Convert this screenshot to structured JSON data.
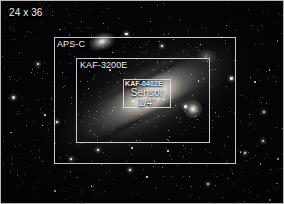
{
  "diagram": {
    "background_image": "andromeda-galaxy-starfield",
    "accent_color": "#e4e4e4",
    "frames": [
      {
        "id": "full-frame",
        "label": "24 x 36",
        "label_position": "top-left-outside",
        "rect": {
          "x": 0,
          "y": 0,
          "w": 284,
          "h": 204
        }
      },
      {
        "id": "aps-c",
        "label": "APS-C",
        "label_position": "top-left-inside",
        "rect": {
          "x": 53,
          "y": 36,
          "w": 182,
          "h": 127
        }
      },
      {
        "id": "kaf-3200e",
        "label": "KAF-3200E",
        "label_position": "top-left-inside",
        "rect": {
          "x": 75,
          "y": 57,
          "w": 134,
          "h": 85
        }
      },
      {
        "id": "kaf-0402e",
        "label": "KAF-0402E",
        "sub_label": "Sensor",
        "size_label": "1/4\"",
        "label_position": "top-left-inside",
        "rect": {
          "x": 122,
          "y": 78,
          "w": 48,
          "h": 29
        }
      }
    ]
  },
  "chart_data": {
    "type": "diagram",
    "categories": [
      "24 x 36",
      "APS-C",
      "KAF-3200E",
      "KAF-0402E Sensor 1/4\""
    ],
    "series": [
      {
        "name": "width_px",
        "values": [
          284,
          182,
          134,
          48
        ]
      },
      {
        "name": "height_px",
        "values": [
          204,
          127,
          85,
          29
        ]
      }
    ],
    "xlabel": "",
    "ylabel": "",
    "legend": "none",
    "grid": false
  }
}
